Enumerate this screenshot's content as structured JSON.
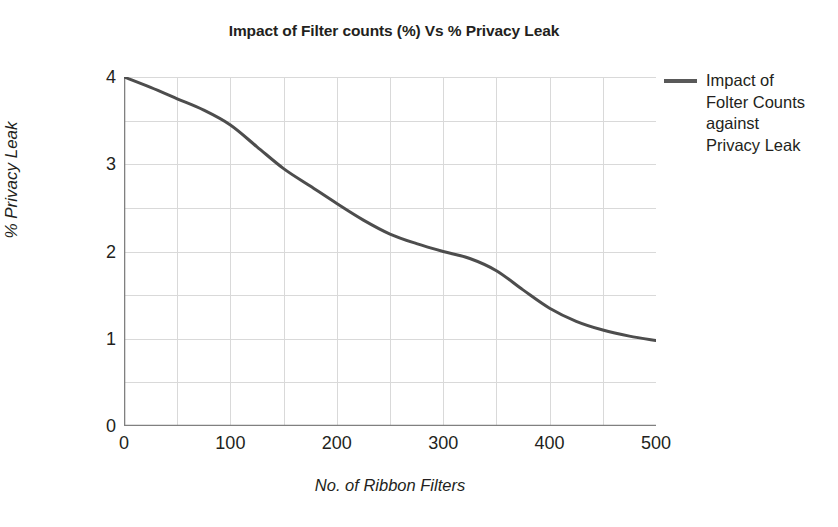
{
  "chart_data": {
    "type": "line",
    "title": "Impact of Filter counts (%) Vs % Privacy Leak",
    "xlabel": "No. of Ribbon Filters",
    "ylabel": "% Privacy Leak",
    "xlim": [
      0,
      500
    ],
    "ylim": [
      0,
      4
    ],
    "x_ticks": [
      0,
      100,
      200,
      300,
      400,
      500
    ],
    "x_tick_labels": [
      "0",
      "100",
      "200",
      "300",
      "400",
      "500"
    ],
    "y_ticks": [
      0,
      1,
      2,
      3,
      4
    ],
    "y_tick_labels": [
      "0",
      "1",
      "2",
      "3",
      "4"
    ],
    "grid": true,
    "grid_x_step": 50,
    "grid_y_step": 0.5,
    "grid_color": "#d9d9d9",
    "axis_color": "#808080",
    "legend_position": "right",
    "series": [
      {
        "name": "Impact of Folter Counts against Privacy Leak",
        "color": "#4d4d4d",
        "line_width": 3,
        "x": [
          0,
          25,
          50,
          75,
          100,
          125,
          150,
          175,
          200,
          225,
          250,
          275,
          300,
          325,
          350,
          375,
          400,
          425,
          450,
          475,
          500
        ],
        "values": [
          4.0,
          3.88,
          3.75,
          3.62,
          3.45,
          3.2,
          2.95,
          2.75,
          2.55,
          2.36,
          2.2,
          2.09,
          2.0,
          1.92,
          1.78,
          1.56,
          1.35,
          1.2,
          1.1,
          1.03,
          0.98
        ]
      }
    ]
  },
  "legend": {
    "entries": [
      {
        "label": "Impact of Folter Counts against Privacy Leak",
        "color": "#595959"
      }
    ]
  }
}
